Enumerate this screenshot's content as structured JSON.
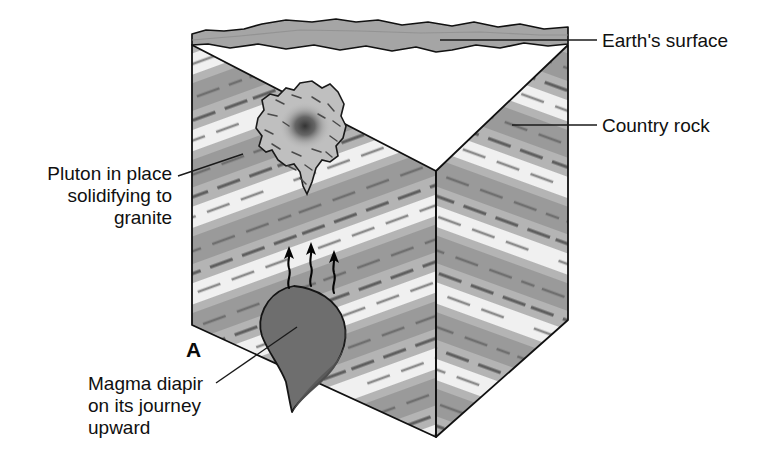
{
  "figure": {
    "panel_letter": "A",
    "title_absent": true,
    "background_color": "#ffffff"
  },
  "labels": [
    {
      "id": "earths-surface",
      "text": "Earth's surface",
      "lines": [
        "Earth's surface"
      ],
      "text_x": 600,
      "text_y": 46,
      "anchor": "start",
      "leader": "M 597 40 L 440 40",
      "points_to": "top surface of block"
    },
    {
      "id": "country-rock",
      "text": "Country rock",
      "lines": [
        "Country rock"
      ],
      "text_x": 600,
      "text_y": 131,
      "anchor": "start",
      "leader": "M 597 125 L 512 125",
      "points_to": "right face banded strata"
    },
    {
      "id": "pluton",
      "text": "Pluton in place solidifying to granite",
      "lines": [
        "Pluton in place",
        "solidifying to",
        "granite"
      ],
      "text_x": 172,
      "text_y": 180,
      "anchor": "end",
      "leader": "M 176 177 L 243 155",
      "points_to": "irregular solidifying pluton body"
    },
    {
      "id": "magma-diapir",
      "text": "Magma diapir on its journey upward",
      "lines": [
        "Magma diapir",
        "on its journey",
        "upward"
      ],
      "text_x": 88,
      "text_y": 386,
      "anchor": "start",
      "leader": "M 218 382 L 296 327",
      "points_to": "rising teardrop-shaped magma diapir"
    }
  ],
  "colors": {
    "band_dark": "#9a9a9a",
    "band_mid": "#b4b4b4",
    "band_light": "#f2f2f2",
    "top_surface": "#a8a8a8",
    "diapir_fill": "#6e6e6e",
    "pluton_fill": "#bdbdbd",
    "pluton_core": "#3d3d3d",
    "outline": "#111111",
    "text": "#101010"
  },
  "geology": {
    "block_type": "cut-away block diagram",
    "left_face_dip": "bands dip up to the right",
    "right_face_dip": "bands dip down to the right",
    "surface_profile": "irregular undulating ground surface",
    "arrow_count": 3,
    "arrow_meaning": "magma ascent direction"
  }
}
